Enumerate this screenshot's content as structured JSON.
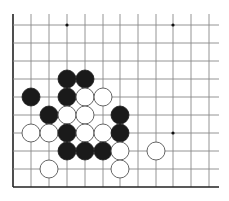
{
  "board": {
    "title": "Go board diagram (partial, lower-left corner)",
    "columns_x": [
      13,
      31,
      49,
      67,
      85,
      103,
      120,
      138,
      156,
      173,
      191,
      209
    ],
    "rows_y": [
      25,
      43,
      61,
      79,
      97,
      115,
      133,
      151,
      169,
      187
    ],
    "line_extent": {
      "top": 14,
      "right": 219
    },
    "border_left_x": 13,
    "border_bottom_y": 187,
    "stone_radius": 9,
    "star_points": [
      {
        "col": 3,
        "row": 0
      },
      {
        "col": 9,
        "row": 0
      },
      {
        "col": 9,
        "row": 6
      }
    ],
    "colors": {
      "grid": "#888888",
      "border": "#222222",
      "black_stone": "#1a1a1a",
      "white_stone_fill": "#ffffff",
      "white_stone_outline": "#555555"
    },
    "stones": [
      {
        "color": "black",
        "col": 3,
        "row": 3
      },
      {
        "color": "black",
        "col": 4,
        "row": 3
      },
      {
        "color": "black",
        "col": 1,
        "row": 4
      },
      {
        "color": "black",
        "col": 3,
        "row": 4
      },
      {
        "color": "white",
        "col": 4,
        "row": 4
      },
      {
        "color": "white",
        "col": 5,
        "row": 4
      },
      {
        "color": "black",
        "col": 2,
        "row": 5
      },
      {
        "color": "white",
        "col": 3,
        "row": 5
      },
      {
        "color": "white",
        "col": 4,
        "row": 5
      },
      {
        "color": "black",
        "col": 6,
        "row": 5
      },
      {
        "color": "white",
        "col": 1,
        "row": 6
      },
      {
        "color": "white",
        "col": 2,
        "row": 6
      },
      {
        "color": "black",
        "col": 3,
        "row": 6
      },
      {
        "color": "white",
        "col": 4,
        "row": 6
      },
      {
        "color": "white",
        "col": 5,
        "row": 6
      },
      {
        "color": "black",
        "col": 6,
        "row": 6
      },
      {
        "color": "black",
        "col": 3,
        "row": 7
      },
      {
        "color": "black",
        "col": 4,
        "row": 7
      },
      {
        "color": "black",
        "col": 5,
        "row": 7
      },
      {
        "color": "white",
        "col": 6,
        "row": 7
      },
      {
        "color": "white",
        "col": 8,
        "row": 7
      },
      {
        "color": "white",
        "col": 2,
        "row": 8
      },
      {
        "color": "white",
        "col": 6,
        "row": 8
      }
    ]
  }
}
